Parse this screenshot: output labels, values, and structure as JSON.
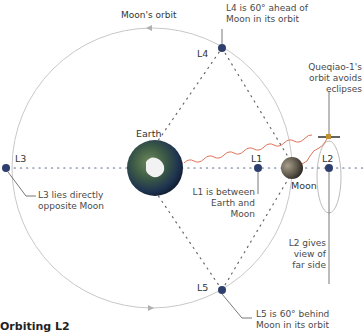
{
  "diagram": {
    "orbit_label": "Moon's orbit",
    "bodies": {
      "earth": "Earth",
      "moon": "Moon"
    },
    "points": {
      "L1": "L1",
      "L2": "L2",
      "L3": "L3",
      "L4": "L4",
      "L5": "L5"
    },
    "annotations": {
      "l4": [
        "L4 is 60° ahead of",
        "Moon in its orbit"
      ],
      "l5": [
        "L5 is 60° behind",
        "Moon in its orbit"
      ],
      "l3": [
        "L3 lies directly",
        "opposite Moon"
      ],
      "l1": [
        "L1 is between",
        "Earth and",
        "Moon"
      ],
      "l2": [
        "L2 gives",
        "view of",
        "far side"
      ],
      "queqiao": [
        "Queqiao-1's",
        "orbit avoids",
        "eclipses"
      ]
    },
    "footer_title": "Orbiting L2",
    "colors": {
      "orbit": "#c8c8c8",
      "point_fill": "#2e3f6e",
      "wave": "#e0735a",
      "dots": "#5a5a5a",
      "leader": "#555555"
    }
  }
}
